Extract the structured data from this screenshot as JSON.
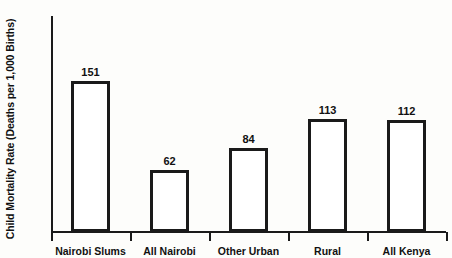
{
  "chart_data": {
    "type": "bar",
    "title": "",
    "xlabel": "",
    "ylabel": "Child Mortality Rate (Deaths per 1,000 Births)",
    "categories": [
      "Nairobi Slums",
      "All Nairobi",
      "Other Urban",
      "Rural",
      "All Kenya"
    ],
    "values": [
      151,
      62,
      84,
      113,
      112
    ],
    "value_labels": [
      "151",
      "62",
      "84",
      "113",
      "112"
    ],
    "ylim": [
      0,
      216
    ],
    "yticks": [
      0,
      50,
      100,
      150,
      200
    ],
    "ytick_labels": [
      "0",
      "50",
      "100",
      "150",
      "200"
    ],
    "grid": false,
    "legend": false,
    "bar_style": {
      "fill": "#ffffff",
      "outline": "#1a1a1a"
    },
    "axis_color": "#1a1a1a",
    "background": "#fdfdfb"
  }
}
